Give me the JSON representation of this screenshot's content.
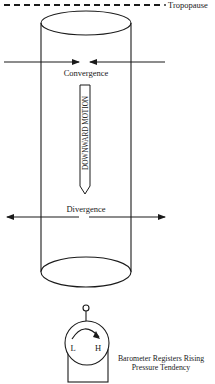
{
  "diagram": {
    "tropopause_label": "Tropopause",
    "convergence_label": "Convergence",
    "downward_motion_label": "DOWNWARD MOTION",
    "divergence_label": "Divergence",
    "barometer": {
      "low_label": "L",
      "high_label": "H",
      "caption_line1": "Barometer Registers Rising",
      "caption_line2": "Pressure Tendency"
    },
    "colors": {
      "stroke": "#1a1a1a",
      "background": "#ffffff"
    }
  }
}
